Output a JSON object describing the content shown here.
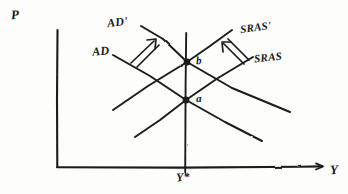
{
  "figure": {
    "style": "hand-drawn pencil sketch on white paper",
    "ink_color": "#1c1c1c",
    "paper_color": "#fdfdfc"
  },
  "axes": {
    "y_axis_label": "P",
    "x_axis_label": "Y",
    "origin": {
      "x": 57,
      "y": 167
    },
    "y_axis_top": {
      "x": 57,
      "y": 30
    },
    "x_axis_right": {
      "x": 322,
      "y": 167
    }
  },
  "potential_output": {
    "label": "Y*",
    "tick_x": 185,
    "line_top": {
      "x": 186,
      "y": 33
    },
    "line_bottom": {
      "x": 185,
      "y": 167
    }
  },
  "curves": [
    {
      "name": "AD",
      "label": "AD",
      "kind": "aggregate-demand",
      "slope": "downward",
      "from": {
        "x": 113,
        "y": 55
      },
      "to": {
        "x": 262,
        "y": 141
      }
    },
    {
      "name": "AD-prime",
      "label": "AD'",
      "kind": "aggregate-demand-shifted",
      "slope": "downward",
      "from": {
        "x": 141,
        "y": 26
      },
      "to": {
        "x": 290,
        "y": 112
      }
    },
    {
      "name": "SRAS",
      "label": "SRAS",
      "kind": "short-run-aggregate-supply",
      "slope": "upward",
      "from": {
        "x": 135,
        "y": 137
      },
      "to": {
        "x": 253,
        "y": 57
      }
    },
    {
      "name": "SRAS-prime",
      "label": "SRAS'",
      "kind": "short-run-aggregate-supply-shifted",
      "slope": "upward",
      "from": {
        "x": 113,
        "y": 110
      },
      "to": {
        "x": 232,
        "y": 30
      }
    }
  ],
  "equilibria": [
    {
      "label": "a",
      "description": "initial equilibrium, AD crosses SRAS at Y*",
      "x": 186,
      "y": 100
    },
    {
      "label": "b",
      "description": "new equilibrium, AD' crosses SRAS' at Y* with higher price level",
      "x": 187,
      "y": 62
    }
  ],
  "shift_arrows": [
    {
      "name": "ad-shift-arrow",
      "direction": "up-right",
      "meaning": "aggregate demand increases",
      "from": {
        "x": 131,
        "y": 62
      },
      "to": {
        "x": 155,
        "y": 40
      }
    },
    {
      "name": "sras-shift-arrow",
      "direction": "up-left",
      "meaning": "short-run aggregate supply decreases",
      "from": {
        "x": 243,
        "y": 63
      },
      "to": {
        "x": 222,
        "y": 42
      }
    }
  ]
}
